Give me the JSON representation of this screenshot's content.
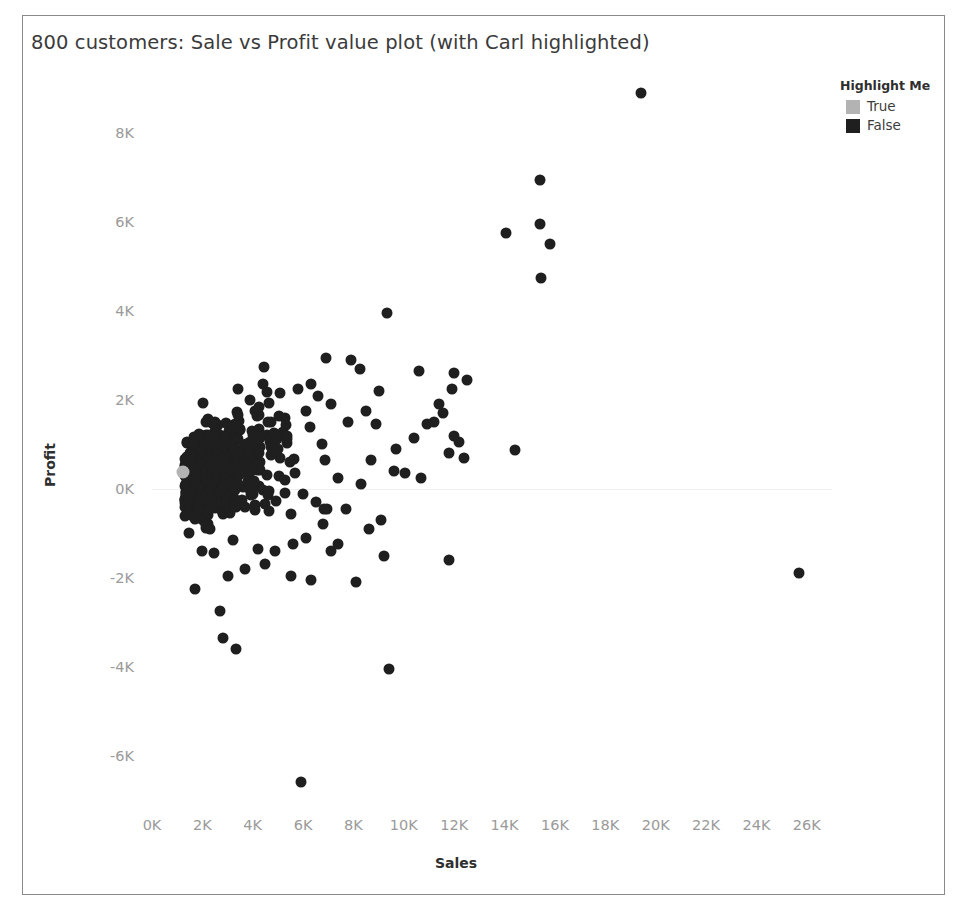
{
  "chart_data": {
    "type": "scatter",
    "title": "800 customers: Sale vs Profit value plot (with Carl highlighted)",
    "xlabel": "Sales",
    "ylabel": "Profit",
    "xlim": [
      0,
      27000
    ],
    "ylim": [
      -7000,
      9200
    ],
    "xticks": [
      "0K",
      "2K",
      "4K",
      "6K",
      "8K",
      "10K",
      "12K",
      "14K",
      "16K",
      "18K",
      "20K",
      "22K",
      "24K",
      "26K"
    ],
    "xtick_values": [
      0,
      2000,
      4000,
      6000,
      8000,
      10000,
      12000,
      14000,
      16000,
      18000,
      20000,
      22000,
      24000,
      26000
    ],
    "yticks": [
      "8K",
      "6K",
      "4K",
      "2K",
      "0K",
      "-2K",
      "-4K",
      "-6K"
    ],
    "ytick_values": [
      8000,
      6000,
      4000,
      2000,
      0,
      -2000,
      -4000,
      -6000
    ],
    "grid": false,
    "n_points": 800,
    "point_size_px": 11,
    "legend": {
      "position": "top-right",
      "title": "Highlight Me",
      "entries": [
        {
          "label": "True",
          "color": "#b3b3b3"
        },
        {
          "label": "False",
          "color": "#1f1f1f"
        }
      ]
    },
    "series": [
      {
        "name": "False",
        "color": "#1f1f1f",
        "description": "Bulk of 799 customers; dense cluster near origin fanning out to higher sales with wider profit spread",
        "cluster": {
          "n": 640,
          "x_mode": 2200,
          "x_scale": 1500,
          "slope": 0.16,
          "noise_base": 260,
          "noise_growth": 0.085
        },
        "outliers": [
          [
            19400,
            8900
          ],
          [
            15400,
            6950
          ],
          [
            14050,
            5750
          ],
          [
            15400,
            5950
          ],
          [
            15800,
            5500
          ],
          [
            15450,
            4750
          ],
          [
            9350,
            3950
          ],
          [
            6900,
            2950
          ],
          [
            7900,
            2900
          ],
          [
            8250,
            2700
          ],
          [
            10600,
            2650
          ],
          [
            12000,
            2600
          ],
          [
            12500,
            2450
          ],
          [
            11900,
            2250
          ],
          [
            6300,
            2350
          ],
          [
            9000,
            2200
          ],
          [
            11400,
            1900
          ],
          [
            11550,
            1700
          ],
          [
            11200,
            1500
          ],
          [
            12000,
            1200
          ],
          [
            14400,
            870
          ],
          [
            10050,
            350
          ],
          [
            11800,
            800
          ],
          [
            12400,
            700
          ],
          [
            9100,
            -700
          ],
          [
            8100,
            -2100
          ],
          [
            9200,
            -1500
          ],
          [
            11800,
            -1600
          ],
          [
            9400,
            -4050
          ],
          [
            5900,
            -6600
          ],
          [
            25700,
            -1900
          ],
          [
            1700,
            -2250
          ],
          [
            2700,
            -2750
          ],
          [
            2800,
            -3350
          ],
          [
            3350,
            -3600
          ],
          [
            3000,
            -1950
          ],
          [
            3700,
            -1800
          ],
          [
            4500,
            -1700
          ],
          [
            5500,
            -1950
          ],
          [
            6300,
            -2050
          ],
          [
            7400,
            -1250
          ],
          [
            2000,
            -1400
          ],
          [
            2450,
            -1450
          ],
          [
            1450,
            -1000
          ],
          [
            4200,
            -1350
          ],
          [
            4900,
            -1400
          ],
          [
            5600,
            -1250
          ],
          [
            6100,
            -1100
          ],
          [
            7100,
            -1400
          ],
          [
            8600,
            -900
          ],
          [
            6800,
            -800
          ],
          [
            3200,
            -1150
          ],
          [
            2300,
            -900
          ],
          [
            8900,
            1450
          ],
          [
            10400,
            1150
          ],
          [
            9700,
            900
          ],
          [
            8500,
            1750
          ],
          [
            7800,
            1500
          ],
          [
            7100,
            1900
          ],
          [
            6100,
            1750
          ],
          [
            5300,
            1600
          ],
          [
            4600,
            1500
          ],
          [
            4100,
            1750
          ],
          [
            3500,
            1350
          ],
          [
            8700,
            650
          ],
          [
            9600,
            400
          ],
          [
            10700,
            250
          ],
          [
            7400,
            250
          ],
          [
            8300,
            100
          ],
          [
            6500,
            -300
          ],
          [
            7700,
            -450
          ],
          [
            5100,
            2150
          ],
          [
            4400,
            2350
          ],
          [
            3900,
            2000
          ],
          [
            5800,
            2250
          ],
          [
            6600,
            2100
          ],
          [
            5000,
            900
          ],
          [
            4300,
            600
          ],
          [
            3600,
            400
          ],
          [
            2900,
            250
          ],
          [
            10900,
            1450
          ],
          [
            12200,
            1050
          ]
        ]
      },
      {
        "name": "True",
        "color": "#b3b3b3",
        "description": "Carl - the single highlighted customer",
        "points": [
          [
            1250,
            380
          ]
        ]
      }
    ]
  },
  "panel": {
    "border_color": "#8a8a8a",
    "background": "#ffffff"
  },
  "axis_style": {
    "tick_color": "#9a9a9a",
    "title_color": "#2f2f2f",
    "zero_line_color": "#f0f0f0"
  }
}
